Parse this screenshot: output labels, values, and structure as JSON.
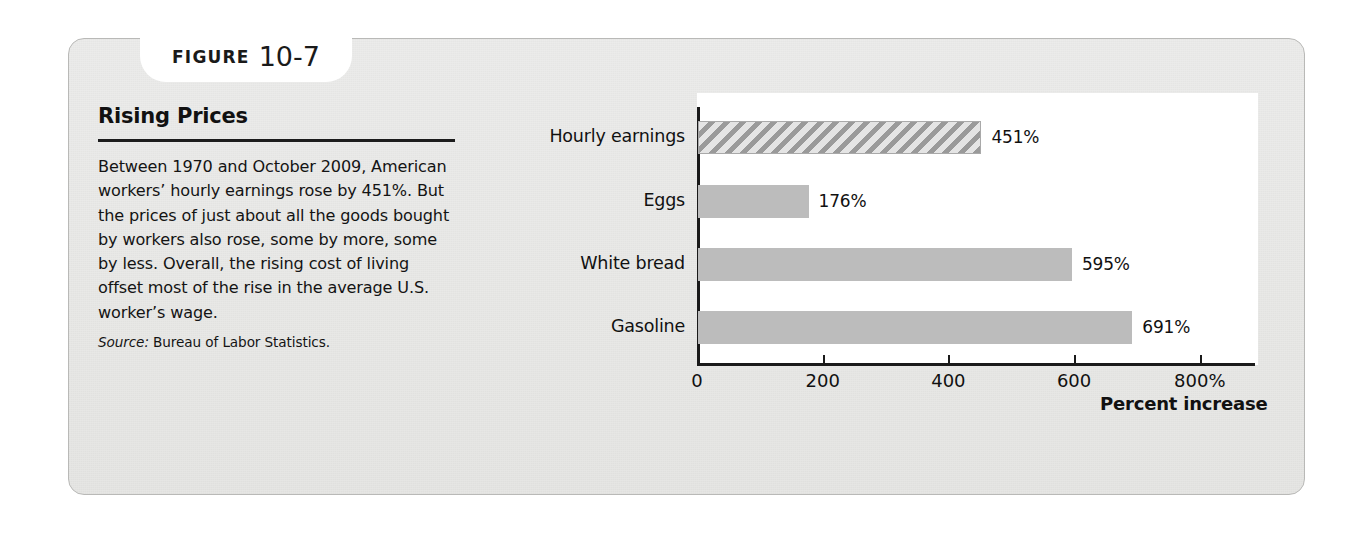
{
  "figure": {
    "tab_word": "FIGURE",
    "tab_number": "10-7",
    "title": "Rising Prices",
    "body": "Between 1970 and October 2009, American workers’ hourly earnings rose by 451%. But the prices of just about all the goods bought by workers also rose, some by more, some by less. Overall, the rising cost of living offset most of the rise in the average U.S. worker’s wage.",
    "source_label": "Source:",
    "source_text": "Bureau of Labor Statistics."
  },
  "colors": {
    "panel_background": "#e9e9e7",
    "panel_border": "#b9b9b7",
    "chart_background": "#ffffff",
    "bar_fill": "#bcbcbc",
    "hatch_stroke": "#9a9a9a",
    "axis": "#1a1a1a",
    "text": "#111111"
  },
  "chart_data": {
    "type": "bar",
    "orientation": "horizontal",
    "title": "Rising Prices",
    "xlabel": "Percent increase",
    "ylabel": "",
    "categories": [
      "Hourly earnings",
      "Eggs",
      "White bread",
      "Gasoline"
    ],
    "values": [
      451,
      176,
      595,
      691
    ],
    "value_labels": [
      "451%",
      "176%",
      "595%",
      "691%"
    ],
    "bar_styles": [
      "hatched",
      "solid",
      "solid",
      "solid"
    ],
    "xlim": [
      0,
      900
    ],
    "xticks": [
      0,
      200,
      400,
      600,
      800
    ],
    "xtick_labels": [
      "0",
      "200",
      "400",
      "600",
      "800%"
    ],
    "grid": false,
    "legend": null
  }
}
